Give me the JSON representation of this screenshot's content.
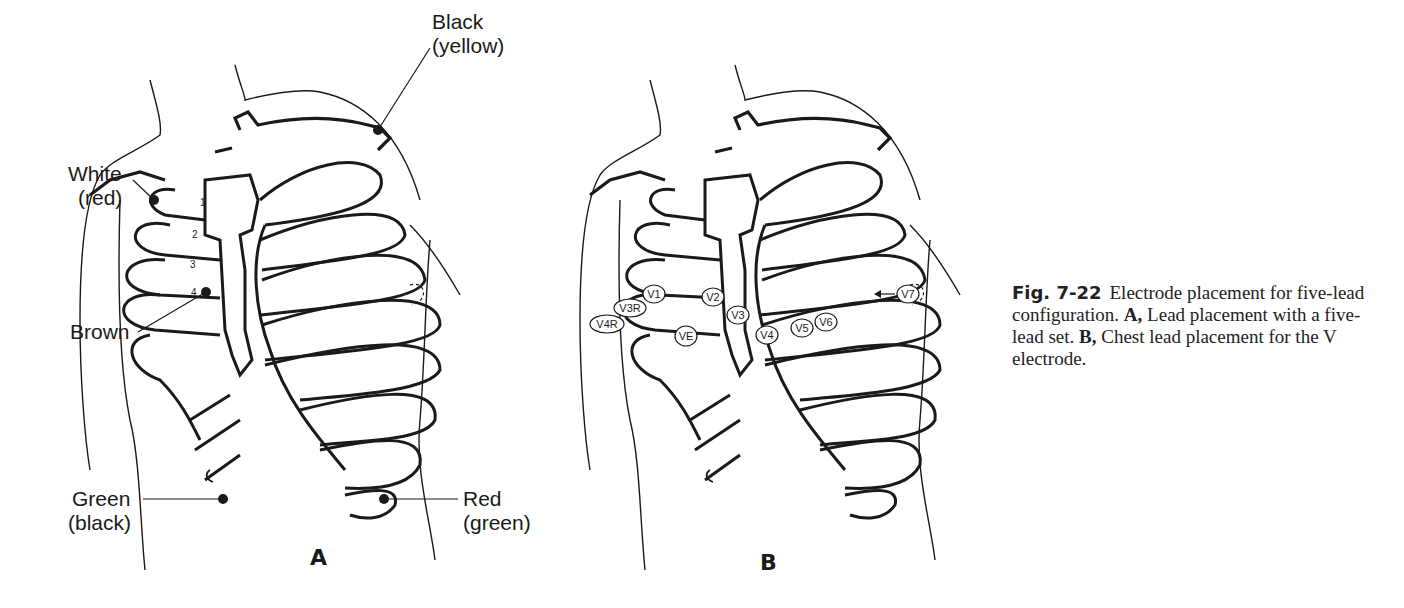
{
  "panel_a": {
    "label": "A",
    "electrodes": [
      {
        "name": "Black",
        "alt": "(yellow)"
      },
      {
        "name": "White",
        "alt": "(red)"
      },
      {
        "name": "Brown",
        "alt": ""
      },
      {
        "name": "Green",
        "alt": "(black)"
      },
      {
        "name": "Red",
        "alt": "(green)"
      }
    ],
    "rib_numbers": [
      "1",
      "2",
      "3",
      "4"
    ]
  },
  "panel_b": {
    "label": "B",
    "v_positions": [
      "V1",
      "V2",
      "V3",
      "V4",
      "V5",
      "V6",
      "V7",
      "V3R",
      "V4R",
      "VE"
    ]
  },
  "caption": {
    "figure_number": "Fig. 7-22",
    "text_1": "Electrode placement for five-lead configuration. ",
    "bold_a": "A,",
    "text_2": " Lead placement with a five-lead set. ",
    "bold_b": "B,",
    "text_3": " Chest lead placement for the V electrode."
  }
}
